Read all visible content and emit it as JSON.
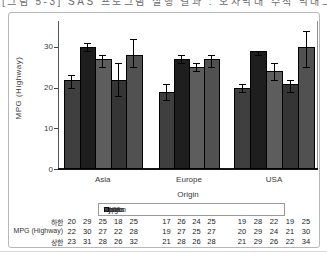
{
  "page": {
    "clipped_top_text": "[그림 5-3] SAS 프로그램 실행 결과 : 오차막대 수직 막대그래프 출력"
  },
  "chart_data": {
    "type": "bar",
    "title": "",
    "xlabel": "Origin",
    "ylabel": "MPG (Highway)",
    "ylim": [
      0,
      34
    ],
    "yticks": [
      0,
      10,
      20,
      30
    ],
    "grid": false,
    "error_bars": true,
    "legend_position": "bottom",
    "legend_title": "Type",
    "categories": [
      "Asia",
      "Europe",
      "USA"
    ],
    "series": [
      {
        "name": "SUV",
        "color": "#3f3f3f",
        "values": [
          22,
          19,
          20
        ],
        "lower": [
          20,
          17,
          19
        ],
        "upper": [
          23,
          21,
          21
        ]
      },
      {
        "name": "Sedan",
        "color": "#1e1e1e",
        "values": [
          30,
          27,
          29
        ],
        "lower": [
          29,
          26,
          28
        ],
        "upper": [
          31,
          28,
          29
        ]
      },
      {
        "name": "Sports",
        "color": "#5d5d5d",
        "values": [
          27,
          25,
          24
        ],
        "lower": [
          25,
          24,
          22
        ],
        "upper": [
          28,
          26,
          26
        ]
      },
      {
        "name": "Truck",
        "color": "#353535",
        "values": [
          22,
          null,
          21
        ],
        "lower": [
          18,
          null,
          19
        ],
        "upper": [
          26,
          null,
          22
        ]
      },
      {
        "name": "Wagon",
        "color": "#515151",
        "values": [
          28,
          27,
          30
        ],
        "lower": [
          25,
          25,
          25
        ],
        "upper": [
          32,
          28,
          34
        ]
      }
    ]
  },
  "table": {
    "rows": [
      {
        "label": "하한",
        "values": [
          [
            20,
            29,
            25,
            18,
            25
          ],
          [
            17,
            26,
            24,
            25
          ],
          [
            19,
            28,
            22,
            19,
            25
          ]
        ]
      },
      {
        "label": "MPG (Highway)",
        "values": [
          [
            22,
            30,
            27,
            22,
            28
          ],
          [
            19,
            27,
            25,
            27
          ],
          [
            20,
            29,
            24,
            21,
            30
          ]
        ]
      },
      {
        "label": "상한",
        "values": [
          [
            23,
            31,
            28,
            26,
            32
          ],
          [
            21,
            28,
            26,
            28
          ],
          [
            21,
            29,
            26,
            22,
            34
          ]
        ]
      }
    ]
  }
}
